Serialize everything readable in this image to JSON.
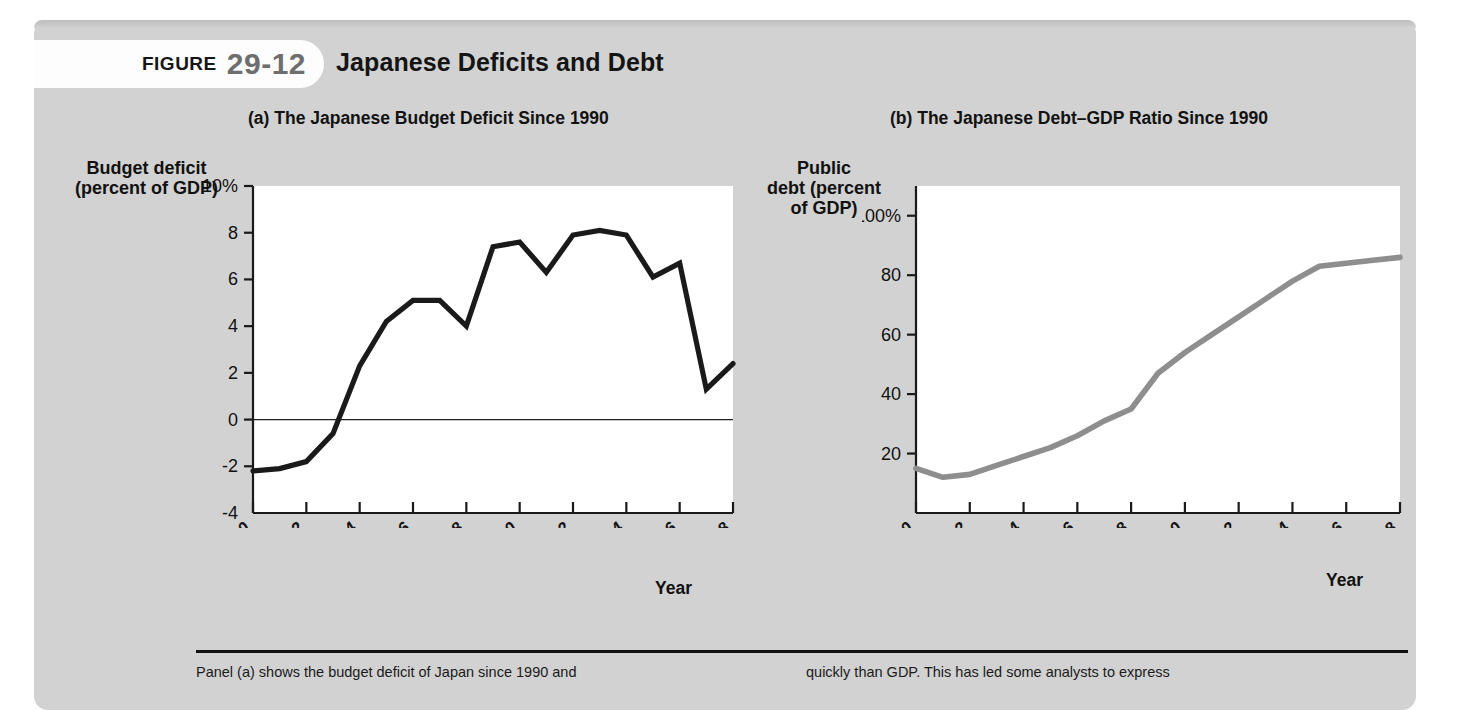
{
  "figure": {
    "badge_word": "FIGURE",
    "badge_number": "29-12",
    "title": "Japanese Deficits and Debt"
  },
  "panels": {
    "a": {
      "title": "(a) The Japanese Budget Deficit Since 1990",
      "ylabel_line1": "Budget deficit",
      "ylabel_line2": "(percent of GDP)",
      "xlabel": "Year"
    },
    "b": {
      "title": "(b) The Japanese Debt–GDP Ratio Since 1990",
      "ylabel_line1": "Public",
      "ylabel_line2": "debt (percent",
      "ylabel_line3": "of GDP)",
      "xlabel": "Year"
    }
  },
  "caption": {
    "left": "Panel (a) shows the budget deficit of Japan since 1990 and",
    "right": "quickly than GDP. This has led some analysts to express"
  },
  "colors": {
    "card_background": "#d2d2d2",
    "plot_background": "#ffffff",
    "deficit_line": "#1a1a1a",
    "debt_line": "#8e8e8e",
    "axis": "#1a1a1a",
    "badge_number": "#6e6e6e"
  },
  "chart_data": [
    {
      "type": "line",
      "panel": "a",
      "title": "(a) The Japanese Budget Deficit Since 1990",
      "xlabel": "Year",
      "ylabel": "Budget deficit (percent of GDP)",
      "xlim": [
        1990,
        2008
      ],
      "ylim": [
        -4,
        10
      ],
      "ytick_labels": [
        "10%",
        "8",
        "6",
        "4",
        "2",
        "0",
        "-2",
        "-4"
      ],
      "ytick_values": [
        10,
        8,
        6,
        4,
        2,
        0,
        -2,
        -4
      ],
      "xtick_labels": [
        "1990",
        "1992",
        "1994",
        "1996",
        "1998",
        "2000",
        "2002",
        "2004",
        "2006",
        "2008"
      ],
      "xtick_values": [
        1990,
        1992,
        1994,
        1996,
        1998,
        2000,
        2002,
        2004,
        2006,
        2008
      ],
      "grid": false,
      "legend": "none",
      "zero_line": true,
      "x": [
        1990,
        1991,
        1992,
        1993,
        1994,
        1995,
        1996,
        1997,
        1998,
        1999,
        2000,
        2001,
        2002,
        2003,
        2004,
        2005,
        2006,
        2007,
        2008
      ],
      "values": [
        -2.2,
        -2.1,
        -1.8,
        -0.6,
        2.3,
        4.2,
        5.1,
        5.1,
        4.0,
        7.4,
        7.6,
        6.3,
        7.9,
        8.1,
        7.9,
        6.1,
        6.7,
        1.3,
        2.4
      ]
    },
    {
      "type": "line",
      "panel": "b",
      "title": "(b) The Japanese Debt–GDP Ratio Since 1990",
      "xlabel": "Year",
      "ylabel": "Public debt (percent of GDP)",
      "xlim": [
        1990,
        2008
      ],
      "ylim": [
        0,
        110
      ],
      "ytick_labels": [
        "100%",
        "80",
        "60",
        "40",
        "20"
      ],
      "ytick_values": [
        100,
        80,
        60,
        40,
        20
      ],
      "xtick_labels": [
        "1990",
        "1992",
        "1994",
        "1996",
        "1998",
        "2000",
        "2002",
        "2004",
        "2006",
        "2008"
      ],
      "xtick_values": [
        1990,
        1992,
        1994,
        1996,
        1998,
        2000,
        2002,
        2004,
        2006,
        2008
      ],
      "grid": false,
      "legend": "none",
      "zero_line": false,
      "x": [
        1990,
        1991,
        1992,
        1993,
        1994,
        1995,
        1996,
        1997,
        1998,
        1999,
        2000,
        2001,
        2002,
        2003,
        2004,
        2005,
        2006,
        2007,
        2008
      ],
      "values": [
        15,
        12,
        13,
        16,
        19,
        22,
        26,
        31,
        35,
        47,
        54,
        60,
        66,
        72,
        78,
        83,
        84,
        85,
        86
      ]
    }
  ]
}
